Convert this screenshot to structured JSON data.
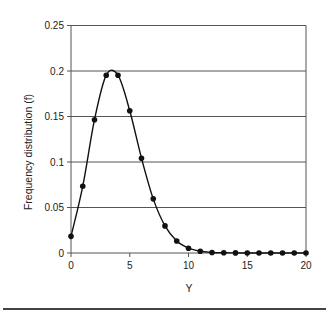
{
  "chart_data": {
    "type": "line",
    "title": "",
    "xlabel": "Y",
    "ylabel": "Frequency distribution (f)",
    "xlim": [
      0,
      20
    ],
    "ylim": [
      0,
      0.25
    ],
    "x_ticks": [
      0,
      5,
      10,
      15,
      20
    ],
    "y_ticks": [
      0,
      0.05,
      0.1,
      0.15,
      0.2,
      0.25
    ],
    "x_tick_labels": [
      "0",
      "5",
      "10",
      "15",
      "20"
    ],
    "y_tick_labels": [
      "0",
      "0.05",
      "0.1",
      "0.15",
      "0.2",
      "0.25"
    ],
    "grid": {
      "horizontal": true,
      "vertical": false
    },
    "legend": null,
    "series": [
      {
        "name": "f",
        "style": "smooth line with filled circle markers",
        "color": "#111111",
        "x": [
          0,
          1,
          2,
          3,
          4,
          5,
          6,
          7,
          8,
          9,
          10,
          11,
          12,
          13,
          14,
          15,
          16,
          17,
          18,
          19,
          20
        ],
        "values": [
          0.0183,
          0.0733,
          0.1465,
          0.1954,
          0.1954,
          0.1563,
          0.1042,
          0.0595,
          0.0298,
          0.0132,
          0.0053,
          0.0019,
          0.0006,
          0.0002,
          0.0001,
          0.0,
          0.0,
          0.0,
          0.0,
          0.0,
          0.0
        ]
      }
    ]
  },
  "colors": {
    "line": "#111111",
    "grid": "#555555",
    "axis": "#555555",
    "text": "#222222"
  }
}
